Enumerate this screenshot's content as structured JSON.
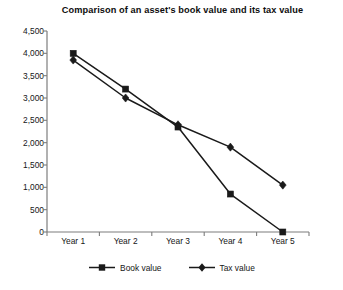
{
  "chart_data": {
    "type": "line",
    "title": "Comparison of an asset's book value and its tax value",
    "xlabel": "",
    "ylabel": "",
    "categories": [
      "Year 1",
      "Year 2",
      "Year 3",
      "Year 4",
      "Year 5"
    ],
    "series": [
      {
        "name": "Book value",
        "marker": "square",
        "color": "#1a1a1a",
        "values": [
          4000,
          3200,
          2350,
          850,
          0
        ]
      },
      {
        "name": "Tax value",
        "marker": "diamond",
        "color": "#1a1a1a",
        "values": [
          3850,
          3000,
          2400,
          1900,
          1050
        ]
      }
    ],
    "ylim": [
      0,
      4500
    ],
    "ytick_step": 500,
    "ytick_labels": [
      "4,500",
      "4,000",
      "3,500",
      "3,000",
      "2,500",
      "2,000",
      "1,500",
      "1,000",
      "500",
      "0"
    ],
    "ytick_values": [
      4500,
      4000,
      3500,
      3000,
      2500,
      2000,
      1500,
      1000,
      500,
      0
    ],
    "grid": false,
    "legend_position": "bottom",
    "axis_color": "#7d7d7d",
    "line_color": "#1a1a1a"
  },
  "legend": {
    "entries": [
      {
        "label": "Book value",
        "marker": "square-marker-icon"
      },
      {
        "label": "Tax value",
        "marker": "diamond-marker-icon"
      }
    ]
  }
}
